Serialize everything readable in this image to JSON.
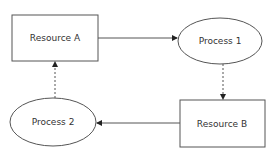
{
  "diagram": {
    "nodes": [
      {
        "id": "resource_a",
        "label": "Resource A",
        "shape": "rectangle"
      },
      {
        "id": "process_1",
        "label": "Process 1",
        "shape": "ellipse"
      },
      {
        "id": "resource_b",
        "label": "Resource B",
        "shape": "rectangle"
      },
      {
        "id": "process_2",
        "label": "Process 2",
        "shape": "ellipse"
      }
    ],
    "edges": [
      {
        "from": "resource_a",
        "to": "process_1",
        "style": "solid"
      },
      {
        "from": "process_1",
        "to": "resource_b",
        "style": "dashed"
      },
      {
        "from": "resource_b",
        "to": "process_2",
        "style": "solid"
      },
      {
        "from": "process_2",
        "to": "resource_a",
        "style": "dashed"
      }
    ],
    "colors": {
      "stroke": "#555555",
      "text": "#333333",
      "background": "#ffffff"
    }
  }
}
